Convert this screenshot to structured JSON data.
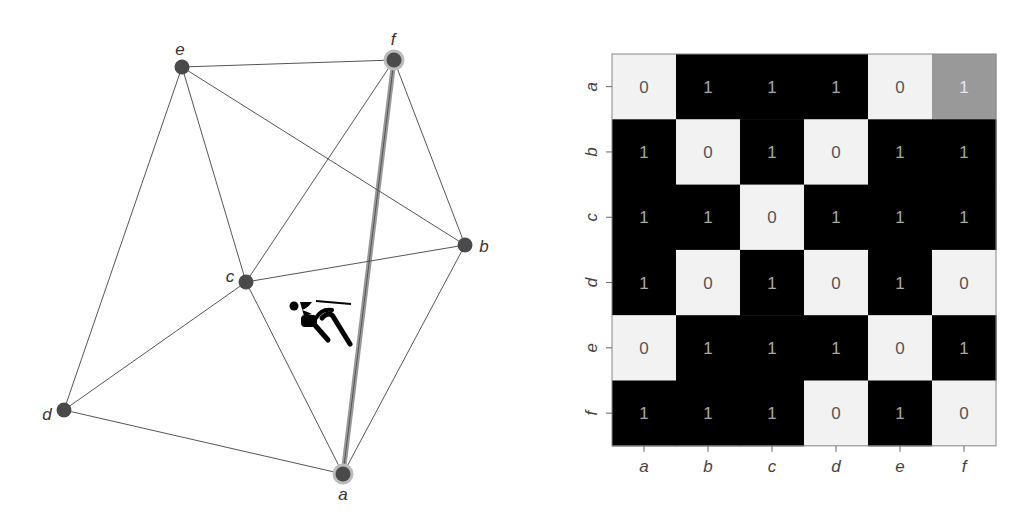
{
  "graph": {
    "nodes": [
      {
        "id": "a",
        "label": "a",
        "x": 343,
        "y": 474,
        "lx": 343,
        "ly": 500,
        "highlighted": true
      },
      {
        "id": "b",
        "label": "b",
        "x": 465,
        "y": 245,
        "lx": 484,
        "ly": 252,
        "highlighted": false
      },
      {
        "id": "c",
        "label": "c",
        "x": 246,
        "y": 282,
        "lx": 230,
        "ly": 282,
        "highlighted": false
      },
      {
        "id": "d",
        "label": "d",
        "x": 64,
        "y": 410,
        "lx": 47,
        "ly": 420,
        "highlighted": false
      },
      {
        "id": "e",
        "label": "e",
        "x": 182,
        "y": 67,
        "lx": 180,
        "ly": 55,
        "highlighted": false
      },
      {
        "id": "f",
        "label": "f",
        "x": 394,
        "y": 60,
        "lx": 393,
        "ly": 45,
        "highlighted": true
      }
    ],
    "edges": [
      [
        "e",
        "f"
      ],
      [
        "e",
        "c"
      ],
      [
        "e",
        "b"
      ],
      [
        "e",
        "d"
      ],
      [
        "f",
        "c"
      ],
      [
        "f",
        "b"
      ],
      [
        "f",
        "a"
      ],
      [
        "c",
        "b"
      ],
      [
        "c",
        "d"
      ],
      [
        "c",
        "a"
      ],
      [
        "d",
        "a"
      ],
      [
        "b",
        "a"
      ]
    ],
    "highlighted_edge": [
      "a",
      "f"
    ],
    "agent_icon": {
      "name": "person-icon",
      "x": 288,
      "y": 296
    },
    "colors": {
      "node": "#4a4a4a",
      "node_halo": "#bbbbbb",
      "edge": "#555555",
      "highlight_edge": "#999999"
    }
  },
  "matrix": {
    "row_labels": [
      "a",
      "b",
      "c",
      "d",
      "e",
      "f"
    ],
    "col_labels": [
      "a",
      "b",
      "c",
      "d",
      "e",
      "f"
    ],
    "values": [
      [
        0,
        1,
        1,
        1,
        0,
        1
      ],
      [
        1,
        0,
        1,
        0,
        1,
        1
      ],
      [
        1,
        1,
        0,
        1,
        1,
        1
      ],
      [
        1,
        0,
        1,
        0,
        1,
        0
      ],
      [
        0,
        1,
        1,
        1,
        0,
        1
      ],
      [
        1,
        1,
        1,
        0,
        1,
        0
      ]
    ],
    "highlighted_cell": [
      0,
      5
    ],
    "colors": {
      "zero_fill": "#f2f2f2",
      "one_fill": "#000000",
      "highlight_fill": "#999999",
      "zero_text": "#555555",
      "one_text": "#a8a8a8",
      "highlight_text": "#e6e6e6"
    }
  }
}
